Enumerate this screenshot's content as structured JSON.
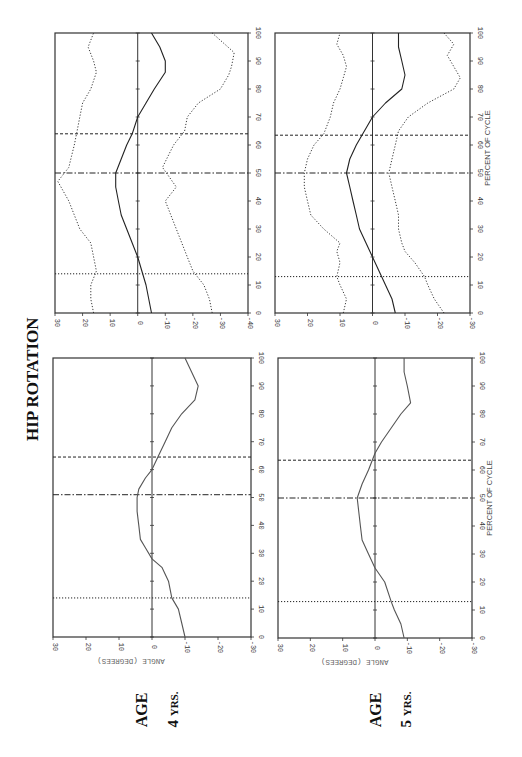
{
  "figure": {
    "title": "HIP ROTATION",
    "age_labels": [
      {
        "age": "AGE",
        "years": "4",
        "unit": "YRS."
      },
      {
        "age": "AGE",
        "years": "5",
        "unit": "YRS."
      }
    ],
    "x_axis_label": "PERCENT OF CYCLE",
    "y_axis_label": "ANGLE (DEGREES)",
    "colors": {
      "line": "#222222",
      "frame": "#333333",
      "light": "#777777"
    }
  },
  "chart_data": [
    {
      "id": "age4-sd",
      "type": "line",
      "title": "HIP ROTATION — AGE 4 YRS (mean ± SD)",
      "xlabel": "PERCENT OF CYCLE",
      "ylabel": "ANGLE (DEGREES)",
      "xlim": [
        0,
        100
      ],
      "ylim": [
        -40,
        30
      ],
      "x_ticks": [
        0,
        10,
        20,
        30,
        40,
        50,
        60,
        70,
        80,
        90,
        100
      ],
      "y_ticks": [
        30,
        20,
        10,
        0,
        -10,
        -20,
        -30,
        -40
      ],
      "show_xlabel": false,
      "show_ylabel": false,
      "event_lines": [
        {
          "x": 14,
          "style": "dotted"
        },
        {
          "x": 50,
          "style": "dashdot"
        },
        {
          "x": 64,
          "style": "dashed"
        }
      ],
      "series": [
        {
          "name": "Mean",
          "style": "solid",
          "x": [
            0,
            10,
            20,
            25,
            30,
            35,
            40,
            45,
            50,
            55,
            60,
            64,
            70,
            75,
            80,
            86,
            90,
            95,
            100
          ],
          "values": [
            -5,
            -3,
            0,
            2,
            4,
            6,
            7,
            8,
            8,
            6,
            4,
            2,
            0,
            -3,
            -6,
            -10,
            -10,
            -8,
            -5
          ]
        },
        {
          "name": "+1 SD",
          "style": "dotted",
          "x": [
            0,
            5,
            10,
            15,
            20,
            25,
            30,
            35,
            40,
            47,
            52,
            56,
            60,
            65,
            70,
            75,
            80,
            86,
            90,
            95,
            100
          ],
          "values": [
            16,
            17,
            17,
            15,
            16,
            17,
            21,
            23,
            25,
            29,
            25,
            24,
            23,
            22,
            21,
            20,
            17,
            15,
            16,
            18,
            16
          ]
        },
        {
          "name": "-1 SD",
          "style": "dotted",
          "x": [
            0,
            5,
            10,
            15,
            20,
            25,
            30,
            35,
            40,
            45,
            52,
            56,
            60,
            65,
            70,
            75,
            80,
            85,
            88,
            93,
            100
          ],
          "values": [
            -27,
            -26,
            -24,
            -20,
            -18,
            -16,
            -14,
            -12,
            -10,
            -14,
            -9,
            -11,
            -13,
            -17,
            -18,
            -22,
            -30,
            -33,
            -34,
            -35,
            -27
          ]
        }
      ]
    },
    {
      "id": "age5-sd",
      "type": "line",
      "title": "HIP ROTATION — AGE 5 YRS (mean ± SD)",
      "xlabel": "PERCENT OF CYCLE",
      "ylabel": "ANGLE (DEGREES)",
      "xlim": [
        0,
        100
      ],
      "ylim": [
        -30,
        30
      ],
      "x_ticks": [
        0,
        10,
        20,
        30,
        40,
        50,
        60,
        70,
        80,
        90,
        100
      ],
      "y_ticks": [
        30,
        20,
        10,
        0,
        -10,
        -20,
        -30
      ],
      "show_xlabel": true,
      "show_ylabel": false,
      "event_lines": [
        {
          "x": 13,
          "style": "dotted"
        },
        {
          "x": 50,
          "style": "dashdot"
        },
        {
          "x": 63.5,
          "style": "dashed"
        }
      ],
      "series": [
        {
          "name": "Mean",
          "style": "solid",
          "x": [
            0,
            5,
            10,
            15,
            20,
            25,
            30,
            35,
            40,
            45,
            50,
            55,
            60,
            64,
            70,
            75,
            80,
            85,
            90,
            95,
            100
          ],
          "values": [
            -7,
            -6,
            -4,
            -2,
            0,
            2,
            4,
            5,
            6,
            7,
            8,
            7,
            5,
            3,
            0,
            -4,
            -9,
            -10,
            -9,
            -8,
            -8
          ]
        },
        {
          "name": "+1 SD",
          "style": "dotted",
          "x": [
            0,
            5,
            10,
            13,
            18,
            22,
            25,
            30,
            35,
            40,
            45,
            50,
            55,
            60,
            64,
            70,
            75,
            80,
            84,
            88,
            92,
            96,
            100
          ],
          "values": [
            9,
            8,
            10,
            11,
            10,
            11,
            10,
            15,
            19,
            20,
            21,
            21,
            20,
            18,
            15,
            13,
            12,
            10,
            9,
            8,
            9,
            11,
            10
          ]
        },
        {
          "name": "-1 SD",
          "style": "dotted",
          "x": [
            0,
            5,
            10,
            13,
            18,
            22,
            25,
            30,
            35,
            40,
            45,
            50,
            55,
            60,
            65,
            70,
            75,
            80,
            84,
            88,
            92,
            96,
            100
          ],
          "values": [
            -22,
            -19,
            -17,
            -16,
            -13,
            -10,
            -9,
            -8,
            -8,
            -7,
            -6,
            -5,
            -6,
            -7,
            -8,
            -11,
            -17,
            -25,
            -27,
            -25,
            -23,
            -25,
            -22
          ]
        }
      ]
    },
    {
      "id": "age4-mean",
      "type": "line",
      "title": "HIP ROTATION — AGE 4 YRS (mean)",
      "xlabel": "PERCENT OF CYCLE",
      "ylabel": "ANGLE (DEGREES)",
      "xlim": [
        0,
        100
      ],
      "ylim": [
        -30,
        30
      ],
      "x_ticks": [
        0,
        10,
        20,
        30,
        40,
        50,
        60,
        70,
        80,
        90,
        100
      ],
      "y_ticks": [
        30,
        20,
        10,
        0,
        -10,
        -20,
        -30
      ],
      "show_xlabel": false,
      "show_ylabel": true,
      "event_lines": [
        {
          "x": 14,
          "style": "dotted"
        },
        {
          "x": 51,
          "style": "dashdot"
        },
        {
          "x": 64.5,
          "style": "dashed"
        }
      ],
      "series": [
        {
          "name": "Mean",
          "style": "solid",
          "x": [
            0,
            5,
            10,
            14,
            20,
            25,
            28,
            32,
            35,
            40,
            45,
            50,
            53,
            57,
            60,
            65,
            70,
            75,
            80,
            85,
            90,
            95,
            100
          ],
          "values": [
            -10,
            -9,
            -8,
            -6,
            -5,
            -3,
            0,
            2,
            3.5,
            4,
            4.5,
            4.5,
            4,
            2,
            0,
            -2,
            -4,
            -6,
            -9,
            -13,
            -14,
            -12,
            -10
          ]
        }
      ]
    },
    {
      "id": "age5-mean",
      "type": "line",
      "title": "HIP ROTATION — AGE 5 YRS (mean)",
      "xlabel": "PERCENT OF CYCLE",
      "ylabel": "ANGLE (DEGREES)",
      "xlim": [
        0,
        100
      ],
      "ylim": [
        -30,
        30
      ],
      "x_ticks": [
        0,
        10,
        20,
        30,
        40,
        50,
        60,
        70,
        80,
        90,
        100
      ],
      "y_ticks": [
        30,
        20,
        10,
        0,
        -10,
        -20,
        -30
      ],
      "show_xlabel": true,
      "show_ylabel": true,
      "event_lines": [
        {
          "x": 13,
          "style": "dotted"
        },
        {
          "x": 50,
          "style": "dashdot"
        },
        {
          "x": 63.5,
          "style": "dashed"
        }
      ],
      "series": [
        {
          "name": "Mean",
          "style": "solid",
          "x": [
            0,
            5,
            10,
            13,
            20,
            25,
            30,
            35,
            40,
            45,
            50,
            55,
            60,
            66,
            70,
            75,
            80,
            84,
            90,
            95,
            100
          ],
          "values": [
            -9,
            -8,
            -6,
            -5,
            -3,
            0,
            2,
            4,
            4.5,
            5,
            5.5,
            4,
            2,
            0,
            -2,
            -5,
            -8,
            -11,
            -10,
            -9,
            -9
          ]
        }
      ]
    }
  ],
  "layout": {
    "panels": [
      {
        "chart": 0,
        "x0": 55,
        "x1": 248,
        "y0": 33,
        "y1": 313
      },
      {
        "chart": 1,
        "x0": 275,
        "x1": 470,
        "y0": 33,
        "y1": 313
      },
      {
        "chart": 2,
        "x0": 53,
        "x1": 251,
        "y0": 358,
        "y1": 637
      },
      {
        "chart": 3,
        "x0": 278,
        "x1": 472,
        "y0": 358,
        "y1": 638
      }
    ]
  }
}
